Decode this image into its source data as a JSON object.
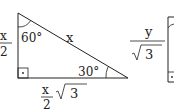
{
  "diagram": {
    "triangle1": {
      "angle_top": "60°",
      "angle_right": "30°",
      "hypotenuse": "x",
      "left_side": {
        "numerator": "x",
        "denominator": "2"
      },
      "bottom_side": {
        "numerator": "x",
        "denominator": "2",
        "radicand": "3"
      }
    },
    "triangle2": {
      "left_side": {
        "numerator": "y",
        "denominator_radicand": "3"
      }
    }
  }
}
